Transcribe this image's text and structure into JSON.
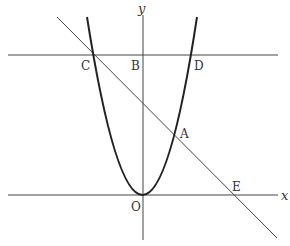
{
  "diagram": {
    "type": "coordinate-geometry",
    "axes": {
      "x_label": "x",
      "y_label": "y",
      "origin_label": "O"
    },
    "points": {
      "A": "A",
      "B": "B",
      "C": "C",
      "D": "D",
      "E": "E"
    },
    "colors": {
      "stroke": "#333333",
      "background": "#ffffff"
    }
  }
}
